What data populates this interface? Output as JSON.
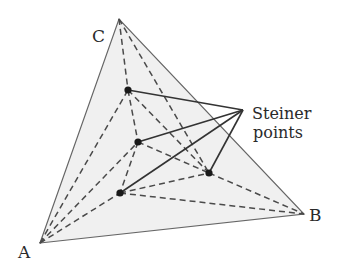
{
  "diagram": {
    "vertices": [
      {
        "id": "A",
        "label": "A",
        "x": 40,
        "y": 243
      },
      {
        "id": "B",
        "label": "B",
        "x": 304,
        "y": 214
      },
      {
        "id": "C",
        "label": "C",
        "x": 119,
        "y": 19
      }
    ],
    "steiner_points": [
      {
        "id": "P1",
        "x": 128,
        "y": 90
      },
      {
        "id": "P2",
        "x": 138,
        "y": 142
      },
      {
        "id": "P3",
        "x": 209,
        "y": 173
      },
      {
        "id": "P4",
        "x": 120,
        "y": 193
      }
    ],
    "dashed_edges": [
      [
        "C",
        "P1"
      ],
      [
        "C",
        "P3"
      ],
      [
        "A",
        "P1"
      ],
      [
        "A",
        "P2"
      ],
      [
        "A",
        "P4"
      ],
      [
        "P1",
        "P2"
      ],
      [
        "P1",
        "P3"
      ],
      [
        "P2",
        "P4"
      ],
      [
        "P2",
        "P3"
      ],
      [
        "P4",
        "P3"
      ],
      [
        "P4",
        "B"
      ],
      [
        "P3",
        "B"
      ]
    ],
    "callout": {
      "line1": "Steiner",
      "line2": "points",
      "anchor": {
        "x": 243,
        "y": 110
      }
    },
    "colors": {
      "fill": "#f0f0f0",
      "edge": "#555555",
      "dash": "#4a4a4a",
      "point": "#1a1a1a",
      "callout_line": "#333333"
    }
  }
}
